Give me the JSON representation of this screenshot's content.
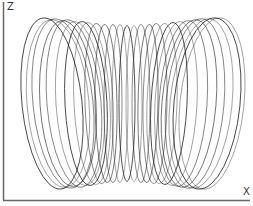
{
  "chart_data": {
    "type": "line",
    "title": "",
    "xlabel": "X",
    "ylabel": "Z",
    "grid": false,
    "legend": null,
    "x_tick_labels": [],
    "y_tick_labels": [],
    "loop_count": 26,
    "x_range_px": [
      22,
      245
    ],
    "z_range_px": [
      12,
      191
    ],
    "series": [
      {
        "name": "trajectory",
        "color": "#1a1a1a",
        "loops": [
          {
            "cx": 52,
            "rx": 30,
            "ry": 86,
            "tilt": -6
          },
          {
            "cx": 58,
            "rx": 31,
            "ry": 84,
            "tilt": -5
          },
          {
            "cx": 63,
            "rx": 30,
            "ry": 85,
            "tilt": -6
          },
          {
            "cx": 68,
            "rx": 28,
            "ry": 83,
            "tilt": -4
          },
          {
            "cx": 74,
            "rx": 27,
            "ry": 84,
            "tilt": -5
          },
          {
            "cx": 80,
            "rx": 24,
            "ry": 82,
            "tilt": -4
          },
          {
            "cx": 86,
            "rx": 21,
            "ry": 82,
            "tilt": -3
          },
          {
            "cx": 92,
            "rx": 18,
            "ry": 81,
            "tilt": -3
          },
          {
            "cx": 99,
            "rx": 14,
            "ry": 80,
            "tilt": -2
          },
          {
            "cx": 106,
            "rx": 11,
            "ry": 79,
            "tilt": -1
          },
          {
            "cx": 113,
            "rx": 9,
            "ry": 79,
            "tilt": 0
          },
          {
            "cx": 120,
            "rx": 8,
            "ry": 79,
            "tilt": 0
          },
          {
            "cx": 127,
            "rx": 8,
            "ry": 78,
            "tilt": 0
          },
          {
            "cx": 134,
            "rx": 8,
            "ry": 78,
            "tilt": 0
          },
          {
            "cx": 141,
            "rx": 9,
            "ry": 79,
            "tilt": 0
          },
          {
            "cx": 148,
            "rx": 10,
            "ry": 79,
            "tilt": 1
          },
          {
            "cx": 155,
            "rx": 12,
            "ry": 80,
            "tilt": 1
          },
          {
            "cx": 162,
            "rx": 15,
            "ry": 80,
            "tilt": 2
          },
          {
            "cx": 169,
            "rx": 18,
            "ry": 81,
            "tilt": 3
          },
          {
            "cx": 176,
            "rx": 21,
            "ry": 82,
            "tilt": 3
          },
          {
            "cx": 183,
            "rx": 24,
            "ry": 83,
            "tilt": 4
          },
          {
            "cx": 189,
            "rx": 27,
            "ry": 84,
            "tilt": 5
          },
          {
            "cx": 195,
            "rx": 29,
            "ry": 85,
            "tilt": 5
          },
          {
            "cx": 201,
            "rx": 31,
            "ry": 85,
            "tilt": 6
          },
          {
            "cx": 207,
            "rx": 33,
            "ry": 86,
            "tilt": 6
          },
          {
            "cx": 212,
            "rx": 32,
            "ry": 86,
            "tilt": 6
          }
        ]
      }
    ]
  },
  "axes": {
    "z_label": "Z",
    "x_label": "X",
    "axis_color": "#666666"
  }
}
